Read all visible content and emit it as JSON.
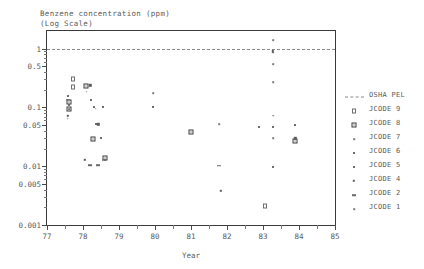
{
  "chart_data": {
    "type": "scatter",
    "title": "Benzene concentration (ppm)",
    "subtitle": "(Log Scale)",
    "xlabel": "Year",
    "ylabel": "",
    "yscale": "log",
    "xlim": [
      77,
      85
    ],
    "ylim": [
      0.001,
      2
    ],
    "grid": false,
    "legend_position": "right",
    "y_ticks": [
      {
        "value": 1,
        "label": "1"
      },
      {
        "value": 0.5,
        "label": "0.5"
      },
      {
        "value": 0.1,
        "label": "0.1"
      },
      {
        "value": 0.05,
        "label": "0.05"
      },
      {
        "value": 0.01,
        "label": "0.01"
      },
      {
        "value": 0.005,
        "label": "0.005"
      },
      {
        "value": 0.001,
        "label": "0.001"
      }
    ],
    "y_minor_ticks": [
      0.9,
      0.8,
      0.7,
      0.6,
      0.4,
      0.3,
      0.2,
      0.09,
      0.08,
      0.07,
      0.06,
      0.04,
      0.03,
      0.02,
      0.009,
      0.008,
      0.007,
      0.006,
      0.004,
      0.003,
      0.002
    ],
    "x_ticks": [
      {
        "value": 77,
        "label": "77"
      },
      {
        "value": 78,
        "label": "78"
      },
      {
        "value": 79,
        "label": "79"
      },
      {
        "value": 80,
        "label": "80"
      },
      {
        "value": 81,
        "label": "81"
      },
      {
        "value": 82,
        "label": "82"
      },
      {
        "value": 83,
        "label": "83"
      },
      {
        "value": 84,
        "label": "84"
      },
      {
        "value": 85,
        "label": "85"
      }
    ],
    "x_minor_ticks": [
      77.5,
      78.5,
      79.5,
      80.5,
      81.5,
      82.5,
      83.5,
      84.5
    ],
    "threshold_line": {
      "name": "OSHA PEL",
      "value": 1,
      "style": "dashed"
    },
    "legend": [
      {
        "label": "OSHA PEL",
        "marker": "dashed-line"
      },
      {
        "label": "JCODE 9",
        "marker": "open-square"
      },
      {
        "label": "JCODE 8",
        "marker": "cross-square"
      },
      {
        "label": "JCODE 7",
        "marker": "dot-xs"
      },
      {
        "label": "JCODE 6",
        "marker": "dot-sm"
      },
      {
        "label": "JCODE 5",
        "marker": "dot-sm"
      },
      {
        "label": "JCODE 4",
        "marker": "dot-md"
      },
      {
        "label": "JCODE 2",
        "marker": "bar"
      },
      {
        "label": "JCODE 1",
        "marker": "dot-xs"
      }
    ],
    "series": [
      {
        "name": "JCODE 9",
        "marker": "open-square",
        "points": [
          {
            "x": 77.72,
            "y": 0.3
          },
          {
            "x": 77.72,
            "y": 0.22
          },
          {
            "x": 83.05,
            "y": 0.0021
          }
        ]
      },
      {
        "name": "JCODE 8",
        "marker": "cross-square",
        "points": [
          {
            "x": 77.62,
            "y": 0.125
          },
          {
            "x": 77.62,
            "y": 0.115
          },
          {
            "x": 78.08,
            "y": 0.345
          },
          {
            "x": 78.28,
            "y": 0.052
          },
          {
            "x": 78.6,
            "y": 0.03
          },
          {
            "x": 81.0,
            "y": 0.1
          },
          {
            "x": 83.9,
            "y": 0.088
          }
        ]
      },
      {
        "name": "JCODE 7",
        "marker": "dot-xs",
        "points": [
          {
            "x": 77.62,
            "y": 0.094
          },
          {
            "x": 78.1,
            "y": 0.185
          },
          {
            "x": 78.35,
            "y": 0.096
          },
          {
            "x": 79.95,
            "y": 0.175
          },
          {
            "x": 83.28,
            "y": 1.4
          },
          {
            "x": 83.28,
            "y": 0.86
          },
          {
            "x": 83.28,
            "y": 0.55
          },
          {
            "x": 83.28,
            "y": 0.27
          },
          {
            "x": 83.28,
            "y": 0.072
          },
          {
            "x": 83.28,
            "y": 0.03
          }
        ]
      },
      {
        "name": "JCODE 6",
        "marker": "dot-sm",
        "points": [
          {
            "x": 77.58,
            "y": 0.155
          },
          {
            "x": 78.22,
            "y": 0.135
          },
          {
            "x": 78.3,
            "y": 0.1
          },
          {
            "x": 78.55,
            "y": 0.1
          },
          {
            "x": 79.95,
            "y": 0.1
          },
          {
            "x": 82.88,
            "y": 0.046
          },
          {
            "x": 83.28,
            "y": 0.046
          },
          {
            "x": 83.9,
            "y": 0.05
          }
        ]
      },
      {
        "name": "JCODE 5",
        "marker": "dot-sm",
        "points": [
          {
            "x": 77.6,
            "y": 0.112
          },
          {
            "x": 78.35,
            "y": 0.052
          },
          {
            "x": 78.5,
            "y": 0.03
          },
          {
            "x": 78.62,
            "y": 0.013
          },
          {
            "x": 83.28,
            "y": 0.0098
          },
          {
            "x": 83.9,
            "y": 0.03
          }
        ]
      },
      {
        "name": "JCODE 4",
        "marker": "dot-md",
        "points": [
          {
            "x": 77.58,
            "y": 0.072
          },
          {
            "x": 78.2,
            "y": 0.24
          },
          {
            "x": 78.42,
            "y": 0.052
          },
          {
            "x": 78.05,
            "y": 0.013
          },
          {
            "x": 81.82,
            "y": 0.0038
          },
          {
            "x": 83.28,
            "y": 0.9
          },
          {
            "x": 83.9,
            "y": 0.03
          }
        ]
      },
      {
        "name": "JCODE 2",
        "marker": "bar",
        "points": [
          {
            "x": 77.58,
            "y": 0.135
          },
          {
            "x": 78.2,
            "y": 0.0105
          },
          {
            "x": 78.42,
            "y": 0.0105
          },
          {
            "x": 81.78,
            "y": 0.0102
          }
        ]
      },
      {
        "name": "JCODE 1",
        "marker": "dot-xs",
        "points": [
          {
            "x": 77.58,
            "y": 0.064
          },
          {
            "x": 78.55,
            "y": 0.0128
          },
          {
            "x": 81.78,
            "y": 0.052
          }
        ]
      }
    ]
  },
  "colors": {
    "axis": "#3a3a3a",
    "text": "#5a5a5a",
    "marker": "#4a4a4a",
    "threshold": "#8a8a8a",
    "background": "#ffffff"
  }
}
